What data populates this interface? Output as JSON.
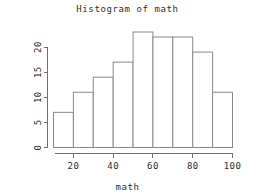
{
  "chart_data": {
    "type": "bar",
    "title": "Histogram of math",
    "xlabel": "math",
    "ylabel": "Frequency",
    "categories": [
      "10-20",
      "20-30",
      "30-40",
      "40-50",
      "50-60",
      "60-70",
      "70-80",
      "80-90",
      "90-100"
    ],
    "bin_edges": [
      10,
      20,
      30,
      40,
      50,
      60,
      70,
      80,
      90,
      100
    ],
    "values": [
      7,
      11,
      14,
      17,
      23,
      22,
      22,
      19,
      11
    ],
    "xlim": [
      10,
      100
    ],
    "ylim": [
      0,
      23
    ],
    "x_ticks": [
      20,
      40,
      60,
      80,
      100
    ],
    "y_ticks": [
      0,
      5,
      10,
      15,
      20
    ],
    "grid": false,
    "legend": "none",
    "bar_fill_color": "#ffffff",
    "bar_border_color": "#8a8a8a",
    "axis_color": "#6f6f6f",
    "background_color": "#ffffff"
  }
}
